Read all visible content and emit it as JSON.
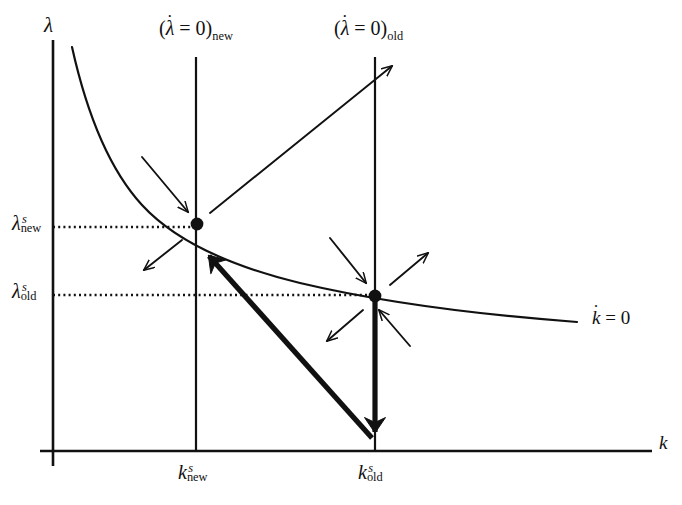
{
  "figure": {
    "type": "phase-diagram",
    "background": "#ffffff",
    "ink_color": "#111111"
  },
  "axes": {
    "x_axis_label": "k",
    "y_axis_label": "λ",
    "x_axis": {
      "y_px": 451,
      "x_start_px": 40,
      "x_end_px": 652
    },
    "y_axis": {
      "x_px": 53,
      "y_start_px": 40,
      "y_end_px": 466
    }
  },
  "loci": {
    "k_dot_zero": {
      "label_base": "k",
      "label_rest": " = 0",
      "label_full": "k̇ = 0",
      "kind": "downward-sloping-convex-curve"
    },
    "lambda_dot_zero_new": {
      "prefix": "(",
      "base": "λ",
      "relation": " = 0)",
      "subscript": "new",
      "label_full": "(λ̇ = 0)new",
      "x_px": 196
    },
    "lambda_dot_zero_old": {
      "prefix": "(",
      "base": "λ",
      "relation": " = 0)",
      "subscript": "old",
      "label_full": "(λ̇ = 0)old",
      "x_px": 375
    }
  },
  "tick_labels": {
    "y": [
      {
        "name": "lambda-s-new",
        "base": "λ",
        "sup": "s",
        "sub": "new",
        "y_px": 227
      },
      {
        "name": "lambda-s-old",
        "base": "λ",
        "sup": "s",
        "sub": "old",
        "y_px": 295
      }
    ],
    "x": [
      {
        "name": "k-s-new",
        "base": "k",
        "sup": "s",
        "sub": "new",
        "x_px": 196
      },
      {
        "name": "k-s-old",
        "base": "k",
        "sup": "s",
        "sub": "old",
        "x_px": 375
      }
    ]
  },
  "steady_states": [
    {
      "name": "new-steady-state",
      "k_label": "kˢnew",
      "lambda_label": "λˢnew",
      "x_px": 197,
      "y_px": 224
    },
    {
      "name": "old-steady-state",
      "k_label": "kˢold",
      "lambda_label": "λˢold",
      "x_px": 375,
      "y_px": 296
    }
  ],
  "guides": [
    {
      "name": "dotted-guide-lambda-new",
      "style": "dotted",
      "from": [
        53,
        227
      ],
      "to": [
        197,
        227
      ]
    },
    {
      "name": "dotted-guide-lambda-old",
      "style": "dotted",
      "from": [
        53,
        295
      ],
      "to": [
        375,
        295
      ]
    }
  ],
  "dynamics_arrows": [
    {
      "name": "arrow-nw-into-new-ss",
      "weight": "thin",
      "from": [
        142,
        157
      ],
      "to": [
        188,
        212
      ]
    },
    {
      "name": "arrow-sw-from-new-ss",
      "weight": "thin",
      "from": [
        182,
        240
      ],
      "to": [
        144,
        270
      ]
    },
    {
      "name": "arrow-ne-saddle-unstable",
      "weight": "thin",
      "from": [
        210,
        213
      ],
      "to": [
        392,
        66
      ]
    },
    {
      "name": "arrow-nw-into-old-ss",
      "weight": "thin",
      "from": [
        330,
        238
      ],
      "to": [
        366,
        283
      ]
    },
    {
      "name": "arrow-ne-from-old-ss",
      "weight": "thin",
      "from": [
        390,
        285
      ],
      "to": [
        428,
        253
      ]
    },
    {
      "name": "arrow-sw-from-old-ss",
      "weight": "thin",
      "from": [
        363,
        310
      ],
      "to": [
        327,
        341
      ]
    },
    {
      "name": "arrow-se-into-old-ss",
      "weight": "thin",
      "from": [
        410,
        346
      ],
      "to": [
        379,
        310
      ]
    }
  ],
  "transition_arrows": [
    {
      "name": "jump-arrow-down",
      "weight": "thick",
      "from": [
        375,
        300
      ],
      "to": [
        375,
        443
      ],
      "meaning": "instantaneous downward jump of lambda at k-old"
    },
    {
      "name": "saddle-path-arrow-to-new-ss",
      "weight": "thick",
      "from": [
        372,
        438
      ],
      "to": [
        203,
        249
      ],
      "meaning": "transition along new saddle path to the new steady state"
    }
  ]
}
